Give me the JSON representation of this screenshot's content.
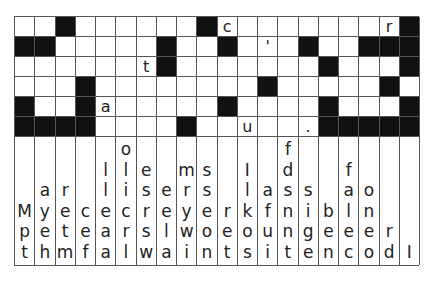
{
  "puzzle": {
    "type": "drop-quote",
    "columns": 20,
    "rows": 6,
    "grid": [
      [
        "",
        "",
        "#",
        "",
        "",
        "",
        "",
        "",
        "",
        "#",
        "c",
        "",
        "",
        "",
        "",
        "",
        "",
        "",
        "r",
        "#"
      ],
      [
        "#",
        "#",
        "",
        "",
        "",
        "",
        "",
        "#",
        "",
        "",
        "#",
        "",
        "'",
        "",
        "#",
        "",
        "",
        "#",
        "#",
        "#"
      ],
      [
        "",
        "",
        "",
        "",
        "",
        "",
        "t",
        "#",
        "",
        "",
        "",
        "",
        "",
        "",
        "",
        "#",
        "",
        "",
        "",
        "#"
      ],
      [
        "",
        "",
        "",
        "#",
        "",
        "",
        "",
        "",
        "",
        "",
        "",
        "",
        "#",
        "",
        "",
        "",
        "",
        "",
        "#",
        ""
      ],
      [
        "#",
        "",
        "",
        "#",
        "a",
        "",
        "",
        "",
        "",
        "",
        "#",
        "",
        "",
        "",
        "",
        "#",
        "",
        "",
        "",
        "#"
      ],
      [
        "#",
        "#",
        "#",
        "#",
        "",
        "",
        "",
        "",
        "#",
        "",
        "",
        "u",
        "",
        "",
        ".",
        "#",
        "#",
        "#",
        "#",
        "#"
      ]
    ],
    "letter_bank": [
      [
        "",
        "",
        "",
        "M",
        "p",
        "t"
      ],
      [
        "",
        "",
        "a",
        "y",
        "e",
        "h"
      ],
      [
        "",
        "",
        "r",
        "e",
        "t",
        "m"
      ],
      [
        "",
        "",
        "",
        "c",
        "e",
        "f"
      ],
      [
        "",
        "l",
        "l",
        "e",
        "a",
        "a"
      ],
      [
        "o",
        "l",
        "i",
        "c",
        "r",
        "l"
      ],
      [
        "",
        "e",
        "s",
        "r",
        "s",
        "w"
      ],
      [
        "",
        "",
        "e",
        "e",
        "l",
        "a"
      ],
      [
        "",
        "m",
        "r",
        "y",
        "w",
        "i"
      ],
      [
        "",
        "s",
        "s",
        "e",
        "o",
        "n"
      ],
      [
        "",
        "",
        "",
        "r",
        "e",
        "t"
      ],
      [
        "",
        "I",
        "l",
        "k",
        "o",
        "s"
      ],
      [
        "",
        "",
        "a",
        "f",
        "u",
        "i"
      ],
      [
        "f",
        "d",
        "s",
        "n",
        "n",
        "t"
      ],
      [
        "",
        "",
        "s",
        "i",
        "g",
        "e"
      ],
      [
        "",
        "",
        "",
        "b",
        "e",
        "n"
      ],
      [
        "",
        "f",
        "a",
        "l",
        "e",
        "c"
      ],
      [
        "",
        "",
        "o",
        "n",
        "e",
        "o"
      ],
      [
        "",
        "",
        "",
        "",
        "r",
        "d"
      ],
      [
        "",
        "",
        "",
        "",
        "",
        "I"
      ]
    ]
  }
}
